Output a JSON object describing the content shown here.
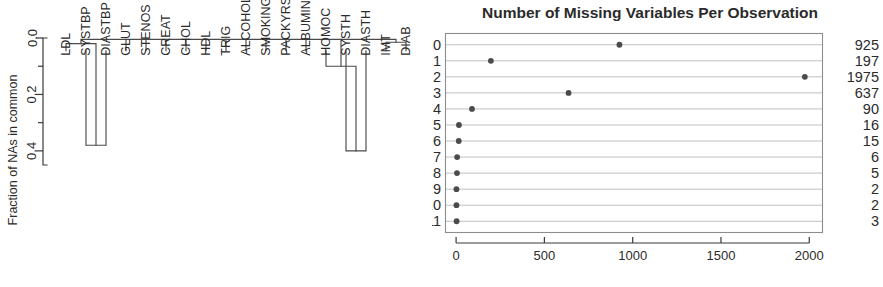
{
  "figure": {
    "panels": [
      "dendrogram",
      "dotchart"
    ]
  },
  "dendrogram": {
    "y_axis_title": "Fraction of NAs in common",
    "y_ticks": [
      "0.0",
      "0.2",
      "0.4"
    ],
    "y_tick_values": [
      0.0,
      0.2,
      0.4
    ],
    "y_minor_tick_values": [
      0.1,
      0.3
    ],
    "y_axis_range": [
      0.0,
      0.45
    ],
    "leaves": [
      "LDL",
      "SYSTBP",
      "DIASTBP",
      "GLUT",
      "STENOS",
      "CREAT",
      "CHOL",
      "HDL",
      "TRIG",
      "ALCOHOL",
      "SMOKING",
      "PACKYRS",
      "ALBUMIN",
      "HOMOC",
      "SYSTH",
      "DIASTH",
      "IMT",
      "DIAB"
    ],
    "merges": [
      {
        "label": "SYSTBP-DIASTBP",
        "left": "SYSTBP",
        "right": "DIASTBP",
        "height": 0.38
      },
      {
        "label": "SYSTH-DIASTH",
        "left": "SYSTH",
        "right": "DIASTH",
        "height": 0.4
      },
      {
        "label": "LDL-BPcluster",
        "left": "LDL",
        "right": "SYSTBP-DIASTBP",
        "height": 0.02
      },
      {
        "label": "HOMOC-THcluster",
        "left": "HOMOC",
        "right": "SYSTH-DIASTH",
        "height": 0.1
      },
      {
        "label": "IMT-DIAB",
        "left": "IMT",
        "right": "DIAB",
        "height": 0.015
      },
      {
        "label": "root",
        "left": "all",
        "right": "all",
        "height": 0.005
      }
    ],
    "leaf_stub_height": 0.045
  },
  "chart_data": {
    "type": "scatter",
    "title": "Number of Missing Variables Per Observation",
    "xlabel": "",
    "ylabel": "",
    "categories": [
      "0",
      "1",
      "2",
      "3",
      "4",
      "5",
      "6",
      "7",
      "8",
      "9",
      "10",
      "11"
    ],
    "values": [
      925,
      197,
      1975,
      637,
      90,
      16,
      15,
      6,
      5,
      2,
      2,
      3
    ],
    "right_labels": [
      "925",
      "197",
      "1975",
      "637",
      "90",
      "16",
      "15",
      "6",
      "5",
      "2",
      "2",
      "3"
    ],
    "x_ticks": [
      "0",
      "500",
      "1000",
      "1500",
      "2000"
    ],
    "x_tick_values": [
      0,
      500,
      1000,
      1500,
      2000
    ],
    "xlim": [
      -60,
      2075
    ],
    "grid": "horizontal",
    "legend": "none",
    "point_color": "#4b4b4b"
  }
}
